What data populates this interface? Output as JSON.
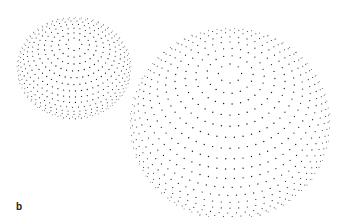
{
  "figure": {
    "panel_label": "b",
    "dot_color": "#1a1a1a",
    "background": "#ffffff",
    "spheres": [
      {
        "name": "small-sphere",
        "cx": 74,
        "cy": 68,
        "rx": 57,
        "ry": 51,
        "tilt_deg": 62,
        "rings": 22,
        "dots_per_ring_base": 60,
        "dot_radius": 0.55
      },
      {
        "name": "large-sphere",
        "cx": 230,
        "cy": 124,
        "rx": 100,
        "ry": 96,
        "tilt_deg": 58,
        "rings": 26,
        "dots_per_ring_base": 72,
        "dot_radius": 0.6,
        "highlight": {
          "label": "marked-dots-region",
          "ring_from": 5,
          "ring_to": 10,
          "lon_from": 0.25,
          "lon_to": 0.75
        }
      }
    ]
  }
}
